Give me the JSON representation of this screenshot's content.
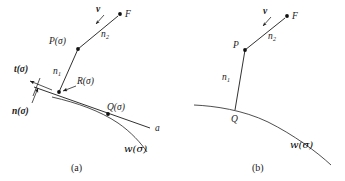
{
  "figure": {
    "background_color": "#ffffff",
    "ink_color": "#1a1a1a",
    "panels": [
      {
        "id": "a",
        "caption": "(a)",
        "labels": {
          "source_point": "F",
          "velocity_vector": "v",
          "ray_upper": "n",
          "ray_upper_sub": "2",
          "ray_lower": "n",
          "ray_lower_sub": "1",
          "point_p": "P(σ)",
          "point_r": "R(σ)",
          "point_q": "Q(σ)",
          "tangent_vector": "t(σ)",
          "normal_vector": "n(σ)",
          "tangent_line": "a",
          "curve": "w(σ)"
        }
      },
      {
        "id": "b",
        "caption": "(b)",
        "labels": {
          "source_point": "F",
          "velocity_vector": "v",
          "ray_upper": "n",
          "ray_upper_sub": "2",
          "ray_lower": "n",
          "ray_lower_sub": "1",
          "point_p": "P",
          "point_q": "Q",
          "curve": "w(σ)"
        }
      }
    ]
  }
}
